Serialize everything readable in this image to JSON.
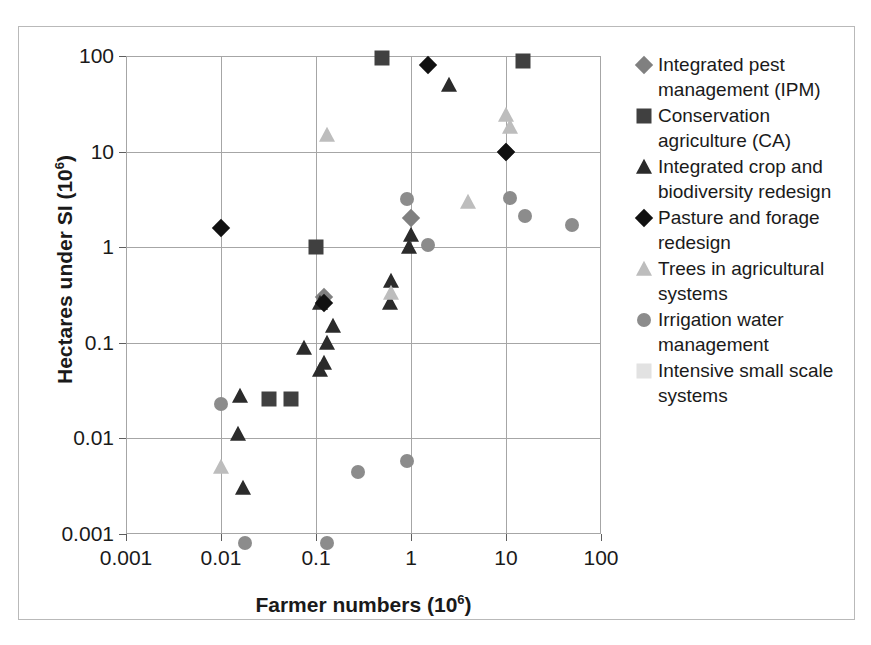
{
  "chart_data": {
    "type": "scatter",
    "title": "",
    "xlabel": "Farmer numbers (10^6)",
    "xlabel_base": "Farmer numbers (10",
    "xlabel_sup": "6",
    "xlabel_tail": ")",
    "ylabel": "Hectares under SI (10^6)",
    "ylabel_base": "Hectares under SI (10",
    "ylabel_sup": "6",
    "ylabel_tail": ")",
    "xscale": "log",
    "yscale": "log",
    "xlim": [
      0.001,
      100
    ],
    "ylim": [
      0.001,
      100
    ],
    "xticks": [
      "0.001",
      "0.01",
      "0.1",
      "1",
      "10",
      "100"
    ],
    "xtick_values": [
      0.001,
      0.01,
      0.1,
      1,
      10,
      100
    ],
    "yticks": [
      "0.001",
      "0.01",
      "0.1",
      "1",
      "10",
      "100"
    ],
    "ytick_values": [
      0.001,
      0.01,
      0.1,
      1,
      10,
      100
    ],
    "grid": true,
    "legend_position": "right",
    "series": [
      {
        "name": "Integrated pest management (IPM)",
        "marker": "diamond",
        "color": "#808080",
        "points": [
          {
            "x": 0.12,
            "y": 0.3
          },
          {
            "x": 1.0,
            "y": 2.0
          },
          {
            "x": 10.0,
            "y": 10.0
          }
        ]
      },
      {
        "name": "Conservation agriculture (CA)",
        "marker": "square",
        "color": "#404040",
        "points": [
          {
            "x": 0.5,
            "y": 95.0
          },
          {
            "x": 15.0,
            "y": 88.0
          },
          {
            "x": 0.1,
            "y": 1.0
          },
          {
            "x": 0.055,
            "y": 0.026
          },
          {
            "x": 0.032,
            "y": 0.026
          }
        ]
      },
      {
        "name": "Integrated crop and biodiversity redesign",
        "marker": "triangle",
        "color": "#2b2b2b",
        "points": [
          {
            "x": 2.5,
            "y": 50.0
          },
          {
            "x": 1.0,
            "y": 1.35
          },
          {
            "x": 0.95,
            "y": 1.0
          },
          {
            "x": 0.62,
            "y": 0.44
          },
          {
            "x": 0.6,
            "y": 0.26
          },
          {
            "x": 0.15,
            "y": 0.15
          },
          {
            "x": 0.13,
            "y": 0.1
          },
          {
            "x": 0.11,
            "y": 0.26
          },
          {
            "x": 0.075,
            "y": 0.088
          },
          {
            "x": 0.12,
            "y": 0.062
          },
          {
            "x": 0.11,
            "y": 0.052
          },
          {
            "x": 0.016,
            "y": 0.028
          },
          {
            "x": 0.015,
            "y": 0.011
          },
          {
            "x": 0.017,
            "y": 0.003
          }
        ]
      },
      {
        "name": "Pasture and forage redesign",
        "marker": "diamond",
        "color": "#111111",
        "points": [
          {
            "x": 1.5,
            "y": 80.0
          },
          {
            "x": 10.0,
            "y": 10.0
          },
          {
            "x": 0.01,
            "y": 1.6
          },
          {
            "x": 0.12,
            "y": 0.26
          }
        ]
      },
      {
        "name": "Trees in agricultural systems",
        "marker": "triangle",
        "color": "#bdbdbd",
        "points": [
          {
            "x": 0.13,
            "y": 15.0
          },
          {
            "x": 10.0,
            "y": 24.0
          },
          {
            "x": 11.0,
            "y": 18.0
          },
          {
            "x": 4.0,
            "y": 3.0
          },
          {
            "x": 0.62,
            "y": 0.33
          },
          {
            "x": 0.01,
            "y": 0.005
          }
        ]
      },
      {
        "name": "Irrigation water management",
        "marker": "circle",
        "color": "#8c8c8c",
        "points": [
          {
            "x": 11.0,
            "y": 3.3
          },
          {
            "x": 16.0,
            "y": 2.1
          },
          {
            "x": 50.0,
            "y": 1.7
          },
          {
            "x": 1.5,
            "y": 1.05
          },
          {
            "x": 0.9,
            "y": 3.2
          },
          {
            "x": 0.9,
            "y": 0.0058
          },
          {
            "x": 0.28,
            "y": 0.0045
          },
          {
            "x": 0.01,
            "y": 0.023
          },
          {
            "x": 0.018,
            "y": 0.0008
          },
          {
            "x": 0.13,
            "y": 0.0008
          }
        ]
      },
      {
        "name": "Intensive small scale systems",
        "marker": "square",
        "color": "#e0e0e0",
        "points": []
      }
    ]
  },
  "legend": {
    "items": [
      {
        "label": "Integrated pest management (IPM)",
        "marker": "diamond",
        "color": "#808080"
      },
      {
        "label": "Conservation agriculture (CA)",
        "marker": "square",
        "color": "#404040"
      },
      {
        "label": "Integrated crop and biodiversity redesign",
        "marker": "triangle",
        "color": "#2b2b2b"
      },
      {
        "label": "Pasture and forage redesign",
        "marker": "diamond",
        "color": "#111111"
      },
      {
        "label": "Trees in agricultural systems",
        "marker": "triangle",
        "color": "#bdbdbd"
      },
      {
        "label": "Irrigation water management",
        "marker": "circle",
        "color": "#8c8c8c"
      },
      {
        "label": "Intensive small scale systems",
        "marker": "square",
        "color": "#e2e2e2"
      }
    ]
  },
  "colors": {
    "grid": "#a6a6a6",
    "frame": "#a6a6a6",
    "outer_border": "#b9b9b9",
    "text": "#1a1a1a"
  }
}
